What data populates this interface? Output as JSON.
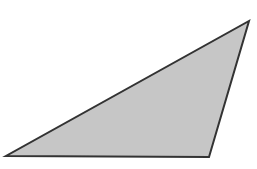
{
  "diagram": {
    "shape": "obtuse-triangle",
    "vertices": [
      [
        6,
        156
      ],
      [
        209,
        157
      ],
      [
        249,
        21
      ]
    ],
    "fill": "#c6c6c6",
    "stroke": "#333333",
    "stroke_width": 2
  }
}
